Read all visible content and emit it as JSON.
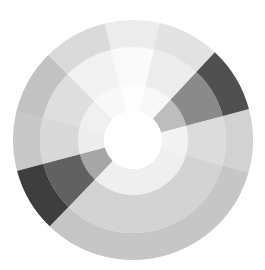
{
  "chart_data": {
    "type": "sunburst",
    "title": "",
    "center": [
      133,
      140
    ],
    "radii": {
      "hole": 29,
      "inner": 55,
      "middle": 93,
      "outer": 120
    },
    "rings": [
      "inner",
      "middle",
      "outer"
    ],
    "segments": [
      {
        "start": -14,
        "end": 13,
        "colors": {
          "outer": "#ececec",
          "middle": "#fafafa",
          "inner": "#fdfdfd"
        }
      },
      {
        "start": 13,
        "end": 43,
        "colors": {
          "outer": "#e2e2e2",
          "middle": "#ededed",
          "inner": "#f8f8f8"
        }
      },
      {
        "start": 43,
        "end": 75,
        "colors": {
          "outer": "#505050",
          "middle": "#8a8a8a",
          "inner": "#bdbdbd"
        }
      },
      {
        "start": 75,
        "end": 106,
        "colors": {
          "outer": "#d2d2d2",
          "middle": "#dcdcdc",
          "inner": "#f3f3f3"
        }
      },
      {
        "start": 106,
        "end": 224,
        "colors": {
          "outer": "#c6c6c6",
          "middle": "#d3d3d3",
          "inner": "#efefef"
        }
      },
      {
        "start": 224,
        "end": 255,
        "colors": {
          "outer": "#3e3e3e",
          "middle": "#616161",
          "inner": "#a6a6a6"
        }
      },
      {
        "start": 255,
        "end": 284,
        "colors": {
          "outer": "#c8c8c8",
          "middle": "#d8d8d8",
          "inner": "#ededed"
        }
      },
      {
        "start": 284,
        "end": 315,
        "colors": {
          "outer": "#c2c2c2",
          "middle": "#dedede",
          "inner": "#f0f0f0"
        }
      },
      {
        "start": 315,
        "end": 346,
        "colors": {
          "outer": "#dadada",
          "middle": "#f2f2f2",
          "inner": "#f8f8f8"
        }
      }
    ],
    "values": [
      27,
      30,
      32,
      31,
      118,
      31,
      29,
      31,
      31
    ],
    "legend": [],
    "xlabel": "",
    "ylabel": ""
  }
}
